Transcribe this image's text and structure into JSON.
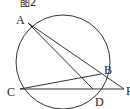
{
  "figure": {
    "title": "图2",
    "circle": {
      "cx": 63,
      "cy": 62,
      "r": 47
    },
    "points": [
      {
        "name": "A",
        "x": 28,
        "y": 23,
        "lx": 16,
        "ly": 24
      },
      {
        "name": "B",
        "x": 101,
        "y": 74,
        "lx": 104,
        "ly": 74
      },
      {
        "name": "C",
        "x": 20,
        "y": 89,
        "lx": 7,
        "ly": 96
      },
      {
        "name": "D",
        "x": 93,
        "y": 89,
        "lx": 95,
        "ly": 106
      },
      {
        "name": "P",
        "x": 124,
        "y": 89,
        "lx": 126,
        "ly": 95
      }
    ],
    "segments": [
      [
        "A",
        "P"
      ],
      [
        "A",
        "D"
      ],
      [
        "C",
        "B"
      ],
      [
        "C",
        "P"
      ]
    ],
    "labels": {
      "A": "A",
      "B": "B",
      "C": "C",
      "D": "D",
      "P": "P"
    }
  }
}
